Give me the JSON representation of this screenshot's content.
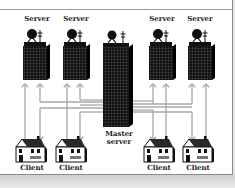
{
  "diagram": {
    "colors": {
      "background": "#ffffff",
      "building": "#111111",
      "grid_lines": "#666666",
      "arrows": "#a8a8a8",
      "text": "#222222",
      "frame": "#8a8a8a"
    },
    "servers": [
      {
        "label": "Server",
        "icon": "server-tower-icon"
      },
      {
        "label": "Server",
        "icon": "server-tower-icon"
      },
      {
        "label": "Server",
        "icon": "server-tower-icon"
      },
      {
        "label": "Server",
        "icon": "server-tower-icon"
      }
    ],
    "master": {
      "label_line1": "Master",
      "label_line2": "server",
      "icon": "master-server-tower-icon"
    },
    "clients": [
      {
        "label": "Client",
        "icon": "house-icon"
      },
      {
        "label": "Client",
        "icon": "house-icon"
      },
      {
        "label": "Client",
        "icon": "house-icon"
      },
      {
        "label": "Client",
        "icon": "house-icon"
      }
    ],
    "connections": {
      "client_to_server": "bidirectional arrows between each client column and server",
      "master_links": "horizontal line bundles connecting master server to all client/server columns"
    }
  }
}
